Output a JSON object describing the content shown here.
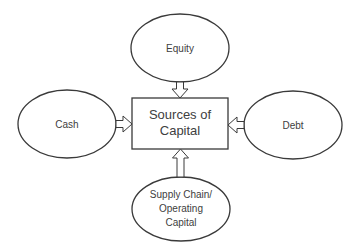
{
  "diagram": {
    "center": {
      "lines": [
        "Sources of",
        "Capital"
      ]
    },
    "nodes": {
      "equity": {
        "lines": [
          "Equity"
        ]
      },
      "cash": {
        "lines": [
          "Cash"
        ]
      },
      "debt": {
        "lines": [
          "Debt"
        ]
      },
      "supply_chain": {
        "lines": [
          "Supply Chain/",
          "Operating",
          "Capital"
        ]
      }
    },
    "colors": {
      "stroke": "#3a3a3a",
      "text": "#404040",
      "fill": "#ffffff",
      "background": "#ffffff"
    }
  }
}
